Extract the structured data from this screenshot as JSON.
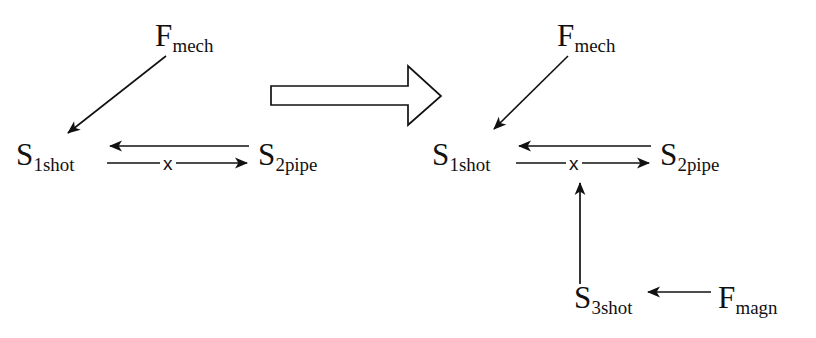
{
  "figure": {
    "background_color": "#ffffff",
    "stroke_color": "#111111"
  },
  "panels": {
    "left": {
      "name": "before-configuration",
      "nodes": {
        "force_mech": {
          "base": "F",
          "sub": "mech",
          "full": "Fmech"
        },
        "state_1": {
          "base": "S",
          "sub": "1shot",
          "full": "S1shot"
        },
        "state_2": {
          "base": "S",
          "sub": "2pipe",
          "full": "S2pipe"
        }
      },
      "edges": {
        "force_to_state1": {
          "label": "",
          "direction": "down-left"
        },
        "state2_to_state1": {
          "label": "",
          "direction": "leftward"
        },
        "state1_to_state2": {
          "label": "x",
          "direction": "rightward",
          "blocked": true
        }
      }
    },
    "right": {
      "name": "after-configuration",
      "nodes": {
        "force_mech": {
          "base": "F",
          "sub": "mech",
          "full": "Fmech"
        },
        "state_1": {
          "base": "S",
          "sub": "1shot",
          "full": "S1shot"
        },
        "state_2": {
          "base": "S",
          "sub": "2pipe",
          "full": "S2pipe"
        },
        "state_3": {
          "base": "S",
          "sub": "3shot",
          "full": "S3shot"
        },
        "force_magn": {
          "base": "F",
          "sub": "magn",
          "full": "Fmagn"
        }
      },
      "edges": {
        "force_to_state1": {
          "label": "",
          "direction": "down-left"
        },
        "state2_to_state1": {
          "label": "",
          "direction": "leftward"
        },
        "state1_to_state2": {
          "label": "x",
          "direction": "rightward",
          "blocked": true
        },
        "state3_to_pair": {
          "label": "",
          "direction": "upward"
        },
        "forcemagn_to_state3": {
          "label": "",
          "direction": "leftward"
        }
      }
    }
  },
  "transform_arrow": {
    "name": "block-arrow",
    "direction": "rightward",
    "style": "hollow-outline"
  }
}
